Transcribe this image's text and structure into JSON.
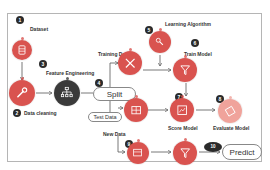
{
  "colors": {
    "red": "#d9534f",
    "red_dark": "#c0392b",
    "dark": "#3a3a3a",
    "green": "#8bbf9f",
    "light_red": "#f0a39b",
    "wire": "#555555",
    "frame": "#b5b5b5"
  },
  "steps": [
    {
      "num": "1",
      "label": "Dataset",
      "icon": "database-icon"
    },
    {
      "num": "2",
      "label": "Data cleaning",
      "icon": "wrench-icon"
    },
    {
      "num": "3",
      "label": "Feature Engineering",
      "icon": "hierarchy-icon"
    },
    {
      "num": "4",
      "label": "Split",
      "icon": ""
    },
    {
      "num": "5",
      "label": "Learning Algorithm",
      "icon": "algorithm-icon"
    },
    {
      "num": "6",
      "label": "Train Model",
      "icon": "filter-icon"
    },
    {
      "num": "7",
      "label": "Score Model",
      "icon": "score-icon"
    },
    {
      "num": "8",
      "label": "Evaluate Model",
      "icon": "evaluate-icon"
    },
    {
      "num": "9",
      "label": "New Data",
      "icon": "dataset-icon"
    },
    {
      "num": "10",
      "label": "Predict",
      "icon": ""
    }
  ],
  "labels": {
    "training_data": "Training Data",
    "test_data": "Test Data"
  }
}
